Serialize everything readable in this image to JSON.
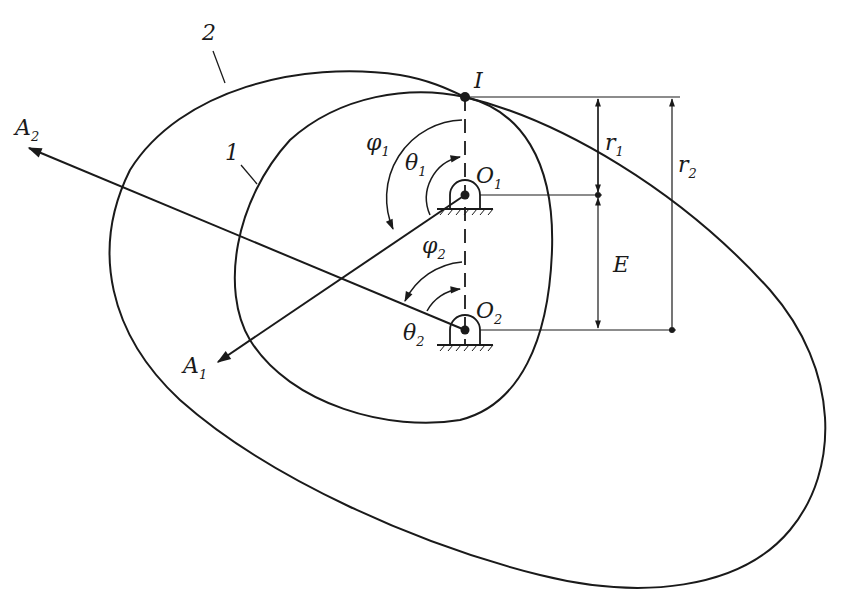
{
  "diagram": {
    "type": "noncircular-gear-pair-geometry",
    "stroke_color": "#1a1a1a",
    "background": "#ffffff",
    "labels": {
      "body_1": "1",
      "body_2": "2",
      "pitch_point": "I",
      "pivot_1": {
        "main": "O",
        "sub": "1"
      },
      "pivot_2": {
        "main": "O",
        "sub": "2"
      },
      "axis_1": {
        "main": "A",
        "sub": "1"
      },
      "axis_2": {
        "main": "A",
        "sub": "2"
      },
      "phi_1": {
        "main": "φ",
        "sub": "1"
      },
      "phi_2": {
        "main": "φ",
        "sub": "2"
      },
      "theta_1": {
        "main": "θ",
        "sub": "1"
      },
      "theta_2": {
        "main": "θ",
        "sub": "2"
      },
      "radius_1": {
        "main": "r",
        "sub": "1"
      },
      "radius_2": {
        "main": "r",
        "sub": "2"
      },
      "center_distance": "E"
    },
    "points": {
      "I": [
        465,
        97
      ],
      "O1": [
        465,
        195
      ],
      "O2": [
        465,
        330
      ]
    }
  }
}
